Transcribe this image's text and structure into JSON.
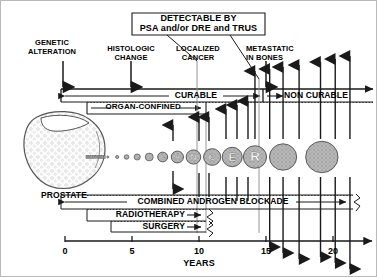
{
  "figure": {
    "callout": {
      "line1": "DETECTABLE BY",
      "line2": "PSA and/or DRE and TRUS"
    },
    "stage_labels": [
      {
        "id": "genetic-alteration",
        "line1": "GENETIC",
        "line2": "ALTERATION",
        "x": 51,
        "y": 38,
        "marker_x": 62,
        "years": 0.3
      },
      {
        "id": "histologic-change",
        "line1": "HISTOLOGIC",
        "line2": "CHANGE",
        "x": 130,
        "y": 42,
        "marker_x": 130,
        "years": 5.5
      },
      {
        "id": "localized-cancer",
        "line1": "LOCALIZED",
        "line2": "CANCER",
        "x": 196,
        "y": 42,
        "marker_x": 196,
        "years": 10.5
      },
      {
        "id": "metastatic-in-bones",
        "line1": "METASTATIC",
        "line2": "IN BONES",
        "x": 272,
        "y": 42,
        "marker_x": 265,
        "years": 14.5
      }
    ],
    "bars": [
      {
        "id": "curable",
        "label": "CURABLE",
        "x1": 62,
        "x2": 262,
        "y": 94,
        "style": "double-arrow"
      },
      {
        "id": "non-curable",
        "label": "NON CURABLE",
        "x1": 265,
        "x2": 370,
        "y": 94,
        "style": "right-arrow"
      },
      {
        "id": "organ-confined",
        "label": "ORGAN-CONFINED",
        "x1": 85,
        "x2": 205,
        "y": 106,
        "style": "right-arrow-dotted"
      },
      {
        "id": "combined-androgen-blockade",
        "label": "COMBINED ANDROGEN BLOCKADE",
        "x1": 62,
        "x2": 352,
        "y": 200,
        "style": "double-arrow-ragged"
      },
      {
        "id": "radiotherapy",
        "label": "RADIOTHERAPY",
        "x1": 85,
        "x2": 205,
        "y": 214,
        "style": "right-arrow-ragged"
      },
      {
        "id": "surgery",
        "label": "SURGERY",
        "x1": 110,
        "x2": 205,
        "y": 226,
        "style": "right-arrow-ragged"
      }
    ],
    "organ": {
      "id": "prostate",
      "label": "PROSTATE",
      "label_x": 63,
      "label_y": 196
    },
    "tumor_word": "CANCER",
    "axis": {
      "label": "YEARS",
      "ticks": [
        {
          "value": "0",
          "x": 64
        },
        {
          "value": "5",
          "x": 131
        },
        {
          "value": "10",
          "x": 198
        },
        {
          "value": "15",
          "x": 265
        },
        {
          "value": "20",
          "x": 332
        }
      ],
      "x_start": 64,
      "x_end": 365,
      "y": 240,
      "min": 0,
      "max": 22.5
    },
    "colors": {
      "ink": "#1a1a1a",
      "tumor_fill": "#b3b3b3",
      "tumor_stroke": "#4d4d4d",
      "prostate_fill": "#fbfbfb",
      "prostate_stroke": "#555555",
      "panel": "#ffffff",
      "frame": "#b9b9b9"
    }
  },
  "chart_data": {
    "type": "timeline",
    "xlabel": "YEARS",
    "xlim": [
      0,
      22.5
    ],
    "xticks": [
      0,
      5,
      10,
      15,
      20
    ],
    "grid": false,
    "legend": "none",
    "events": [
      {
        "name": "GENETIC ALTERATION",
        "year": 0.3
      },
      {
        "name": "HISTOLOGIC CHANGE",
        "year": 5.5
      },
      {
        "name": "LOCALIZED CANCER",
        "year": 10.5
      },
      {
        "name": "METASTATIC IN BONES",
        "year": 14.5
      }
    ],
    "phases": [
      {
        "name": "CURABLE",
        "start": 0.0,
        "end": 14.8
      },
      {
        "name": "NON CURABLE",
        "start": 15.0,
        "end": 22.5
      },
      {
        "name": "ORGAN-CONFINED",
        "start": 1.6,
        "end": 10.6
      },
      {
        "name": "COMBINED ANDROGEN BLOCKADE",
        "start": 0.0,
        "end": 21.5
      },
      {
        "name": "RADIOTHERAPY",
        "start": 1.6,
        "end": 10.6
      },
      {
        "name": "SURGERY",
        "start": 3.5,
        "end": 10.6
      }
    ],
    "detection_window": {
      "name": "DETECTABLE BY PSA and/or DRE and TRUS",
      "start": 10.5,
      "end": 14.5
    },
    "tumor_growth": {
      "ylabel": "tumor size (relative)",
      "letters": [
        "C",
        "A",
        "N",
        "C",
        "E",
        "R"
      ],
      "points": [
        {
          "year": 3.2,
          "radius": 1.0
        },
        {
          "year": 3.9,
          "radius": 1.6
        },
        {
          "year": 4.6,
          "radius": 2.3
        },
        {
          "year": 5.4,
          "radius": 3.1
        },
        {
          "year": 6.3,
          "radius": 4.0
        },
        {
          "year": 7.3,
          "radius": 5.0,
          "letter": "C"
        },
        {
          "year": 8.4,
          "radius": 6.1,
          "letter": "A"
        },
        {
          "year": 9.6,
          "radius": 7.3,
          "letter": "N"
        },
        {
          "year": 11.0,
          "radius": 8.6,
          "letter": "C"
        },
        {
          "year": 12.5,
          "radius": 10.0,
          "letter": "E"
        },
        {
          "year": 14.2,
          "radius": 11.6,
          "letter": "R"
        },
        {
          "year": 16.3,
          "radius": 13.6
        },
        {
          "year": 19.2,
          "radius": 16.2
        }
      ]
    },
    "metastasis_arrows_up": [
      14.2,
      15.3,
      16.3,
      17.5,
      19.1,
      20.2,
      21.3
    ],
    "metastasis_arrows_down": [
      15.3,
      16.3,
      17.5,
      19.1,
      20.2,
      21.3
    ]
  }
}
